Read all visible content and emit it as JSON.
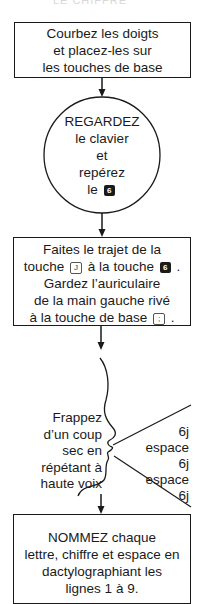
{
  "header": {
    "partial_title": "LE CHIFFRE"
  },
  "steps": [
    {
      "type": "box",
      "lines": [
        "Courbez les doigts",
        "et placez-les sur",
        "les touches de base"
      ]
    },
    {
      "type": "circle",
      "lines": [
        "REGARDEZ",
        "le clavier",
        "et",
        "repérez",
        "le"
      ],
      "key": "6"
    },
    {
      "type": "box",
      "line1": "Faites le trajet de la",
      "line2_pre": "touche",
      "key_from": "J",
      "line2_mid": "à la touche",
      "key_to": "6",
      "line2_post": ".",
      "line3": "Gardez l’auriculaire",
      "line4": "de la main gauche rivé",
      "line5_pre": "à la touche de base",
      "key_base": ";",
      "line5_post": "."
    },
    {
      "type": "speak",
      "lines": [
        "Frappez",
        "d’un coup",
        "sec en",
        "répétant à",
        "haute voix"
      ],
      "sequence": [
        "6j",
        "espace",
        "6j",
        "espace",
        "6j"
      ]
    },
    {
      "type": "box",
      "lines": [
        "NOMMEZ chaque",
        "lettre, chiffre et espace en",
        "dactylographiant les",
        "lignes 1 à 9."
      ],
      "bold_word": "NOMMEZ"
    }
  ],
  "colors": {
    "ink": "#1a1a1a",
    "background": "#ffffff"
  }
}
